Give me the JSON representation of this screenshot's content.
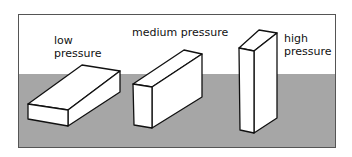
{
  "colors": {
    "ground": "#a6a6a6",
    "sky": "#ffffff",
    "box_face": "#ffffff",
    "outline": "#111111"
  },
  "labels": {
    "low": [
      "low",
      "pressure"
    ],
    "medium": "medium pressure",
    "high": [
      "high",
      "pressure"
    ]
  },
  "boxes": [
    {
      "name": "low-pressure-box",
      "orientation": "lying flat"
    },
    {
      "name": "medium-pressure-box",
      "orientation": "on side"
    },
    {
      "name": "high-pressure-box",
      "orientation": "standing on end"
    }
  ]
}
